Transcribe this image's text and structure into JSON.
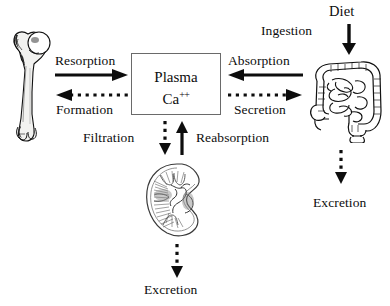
{
  "diagram": {
    "title_hidden": "Calcium homeostasis flow diagram",
    "center": {
      "line1": "Plasma",
      "line2": "Ca",
      "charge": "++"
    },
    "organs": [
      {
        "id": "bone",
        "icon": "femur-bone-illustration",
        "label": ""
      },
      {
        "id": "intestine",
        "icon": "intestine-colon-illustration",
        "label": ""
      },
      {
        "id": "kidney",
        "icon": "kidney-cross-section-illustration",
        "label": ""
      }
    ],
    "labels": {
      "resorption": "Resorption",
      "formation": "Formation",
      "absorption": "Absorption",
      "secretion": "Secretion",
      "filtration": "Filtration",
      "reabsorption": "Reabsorption",
      "diet": "Diet",
      "ingestion": "Ingestion",
      "excretion_kidney": "Excretion",
      "excretion_intestine": "Excretion"
    },
    "arrows": [
      {
        "id": "resorption-arrow",
        "style": "solid",
        "direction": "right"
      },
      {
        "id": "formation-arrow",
        "style": "dotted",
        "direction": "left"
      },
      {
        "id": "absorption-arrow",
        "style": "solid",
        "direction": "left"
      },
      {
        "id": "secretion-arrow",
        "style": "dotted",
        "direction": "right"
      },
      {
        "id": "filtration-arrow",
        "style": "dotted",
        "direction": "down"
      },
      {
        "id": "reabsorption-arrow",
        "style": "solid",
        "direction": "up"
      },
      {
        "id": "diet-ingestion-arrow",
        "style": "solid",
        "direction": "down"
      },
      {
        "id": "kidney-excretion-arrow",
        "style": "dotted",
        "direction": "down"
      },
      {
        "id": "intestine-excretion-arrow",
        "style": "dotted",
        "direction": "down"
      }
    ],
    "colors": {
      "ink": "#0d0d0d",
      "box_border": "#6a6a6a",
      "background": "#ffffff"
    }
  }
}
